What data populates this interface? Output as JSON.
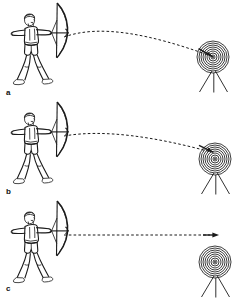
{
  "figure": {
    "background_color": "#ffffff",
    "ink_color": "#1a1a1a",
    "width": 240,
    "height": 298,
    "panel_count": 3,
    "style": "black-and-white line drawing"
  },
  "panels": [
    {
      "label": "a",
      "label_x": 6,
      "label_y": 95,
      "origin_y": 0,
      "archer": {
        "name": "archer-drawing-bow",
        "facing": "right",
        "stance": "wide",
        "attire": "shorts, bare feet, short hair"
      },
      "target": {
        "name": "bullseye-target",
        "center_x": 213,
        "center_y": 57,
        "ring_count": 8,
        "outer_radius": 16,
        "has_stand": true,
        "stand_leg_count": 3,
        "arrow_embedded": true,
        "hit_zone": "bullseye-center"
      },
      "trajectory": {
        "name": "arrow-trajectory-arc-high",
        "style": "dashed",
        "shape": "arched",
        "apex_height_px": 8,
        "start_x": 64,
        "start_y": 37,
        "end_x": 212,
        "end_y": 57,
        "has_arrowhead": false,
        "outcome": "hits bullseye center"
      }
    },
    {
      "label": "b",
      "label_x": 6,
      "label_y": 194,
      "origin_y": 99,
      "archer": {
        "name": "archer-drawing-bow",
        "facing": "right",
        "stance": "wide",
        "attire": "shorts, bare feet, short hair"
      },
      "target": {
        "name": "bullseye-target",
        "center_x": 215,
        "center_y": 159,
        "ring_count": 8,
        "outer_radius": 16,
        "has_stand": true,
        "stand_leg_count": 3,
        "arrow_embedded": true,
        "hit_zone": "upper-left-of-center"
      },
      "trajectory": {
        "name": "arrow-trajectory-arc-flat",
        "style": "dashed",
        "shape": "shallow-arched",
        "apex_height_px": 4,
        "start_x": 64,
        "start_y": 136,
        "end_x": 211,
        "end_y": 152,
        "has_arrowhead": false,
        "outcome": "hits target off-center"
      }
    },
    {
      "label": "c",
      "label_x": 6,
      "label_y": 291,
      "origin_y": 198,
      "archer": {
        "name": "archer-drawing-bow",
        "facing": "right",
        "stance": "wide",
        "attire": "shorts, bare feet, short hair"
      },
      "target": {
        "name": "bullseye-target",
        "center_x": 215,
        "center_y": 262,
        "ring_count": 8,
        "outer_radius": 16,
        "has_stand": true,
        "stand_leg_count": 3,
        "arrow_embedded": false,
        "hit_zone": "none"
      },
      "trajectory": {
        "name": "arrow-trajectory-straight",
        "style": "dashed",
        "shape": "straight-horizontal",
        "apex_height_px": 0,
        "start_x": 64,
        "start_y": 235,
        "end_x": 218,
        "end_y": 235,
        "has_arrowhead": true,
        "outcome": "passes above target, misses"
      }
    }
  ]
}
